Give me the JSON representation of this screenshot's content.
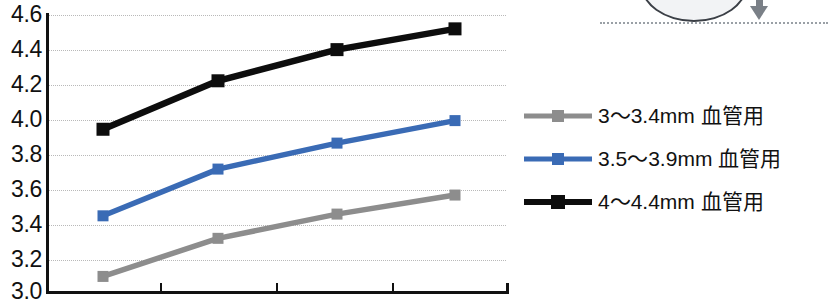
{
  "chart_data": {
    "type": "line",
    "title": "",
    "xlabel": "",
    "ylabel": "",
    "ylim": [
      3.0,
      4.6
    ],
    "ytick_step": 0.2,
    "ytick_labels": [
      "4.6",
      "4.4",
      "4.2",
      "4.0",
      "3.8",
      "3.6",
      "3.4",
      "3.2",
      "3.0"
    ],
    "ytick_values": [
      4.6,
      4.4,
      4.2,
      4.0,
      3.8,
      3.6,
      3.4,
      3.2,
      3.0
    ],
    "grid": true,
    "grid_axis": "y",
    "x": [
      1,
      2,
      3,
      4
    ],
    "xtick_labels": [
      "",
      "",
      "",
      ""
    ],
    "legend_position": "right",
    "series": [
      {
        "name": "3〜3.4mm 血管用",
        "color": "#8d8d8d",
        "marker": "square",
        "values": [
          3.09,
          3.31,
          3.45,
          3.56
        ]
      },
      {
        "name": "3.5〜3.9mm 血管用",
        "color": "#3a6bb5",
        "marker": "square",
        "values": [
          3.44,
          3.71,
          3.86,
          3.99
        ]
      },
      {
        "name": "4〜4.4mm 血管用",
        "color": "#0d0d0d",
        "marker": "square",
        "values": [
          3.94,
          4.22,
          4.4,
          4.52
        ]
      }
    ]
  },
  "legend": {
    "items": [
      {
        "label": "3〜3.4mm 血管用",
        "color": "#8d8d8d"
      },
      {
        "label": "3.5〜3.9mm 血管用",
        "color": "#3a6bb5"
      },
      {
        "label": "4〜4.4mm 血管用",
        "color": "#0d0d0d"
      }
    ]
  },
  "illustration": {
    "shape_name": "ellipse-cross-section",
    "arrow_name": "down-arrow",
    "line_name": "dotted-reference-line",
    "shape_fill": "#f2f3f5",
    "shape_stroke": "#3b3f46",
    "arrow_color": "#7a8087",
    "line_color": "#9aa0a6"
  }
}
